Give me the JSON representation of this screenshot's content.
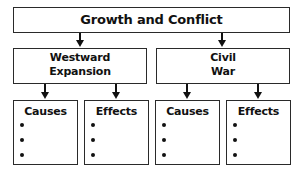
{
  "diagram": {
    "title": "Growth and Conflict",
    "branches": [
      {
        "label_line1": "Westward",
        "label_line2": "Expansion",
        "children": [
          {
            "label": "Causes",
            "bullets": [
              "",
              "",
              ""
            ]
          },
          {
            "label": "Effects",
            "bullets": [
              "",
              "",
              ""
            ]
          }
        ]
      },
      {
        "label_line1": "Civil",
        "label_line2": "War",
        "children": [
          {
            "label": "Causes",
            "bullets": [
              "",
              "",
              ""
            ]
          },
          {
            "label": "Effects",
            "bullets": [
              "",
              "",
              ""
            ]
          }
        ]
      }
    ],
    "colors": {
      "line": "#2a2a2a",
      "text": "#111111",
      "background": "#ffffff"
    }
  }
}
